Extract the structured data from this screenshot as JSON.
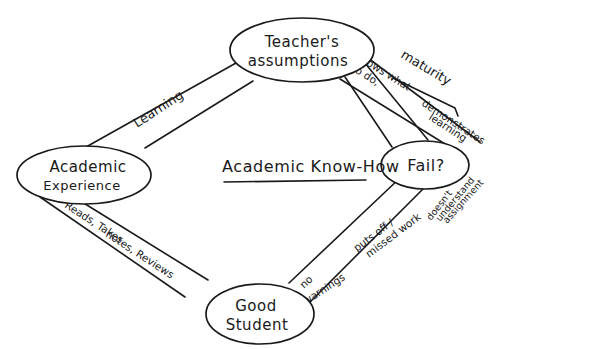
{
  "diagram": {
    "title": "Academic Know-How",
    "nodes": {
      "teacher": {
        "line1": "Teacher's",
        "line2": "assumptions"
      },
      "experience": {
        "line1": "Academic",
        "line2": "Experience"
      },
      "fail": {
        "label": "Fail?"
      },
      "student": {
        "line1": "Good",
        "line2": "Student"
      }
    },
    "edges": {
      "experience_teacher": {
        "label": "Learning"
      },
      "teacher_fail": {
        "outside_label": "maturity",
        "inner_left_1": "knows what",
        "inner_left_2": "to do,",
        "inner_right_1": "demonstrates",
        "inner_right_2": "learning"
      },
      "experience_student": {
        "line1": "Reads, Takes",
        "line2": "notes, Reviews"
      },
      "student_fail": {
        "left_1": "no",
        "left_2": "warnings",
        "mid_1": "puts off /",
        "mid_2": "missed work",
        "right_1": "doesn't",
        "right_2": "understand",
        "right_3": "assignment"
      }
    },
    "colors": {
      "ink": "#1a1a1a",
      "paper": "#ffffff"
    }
  }
}
